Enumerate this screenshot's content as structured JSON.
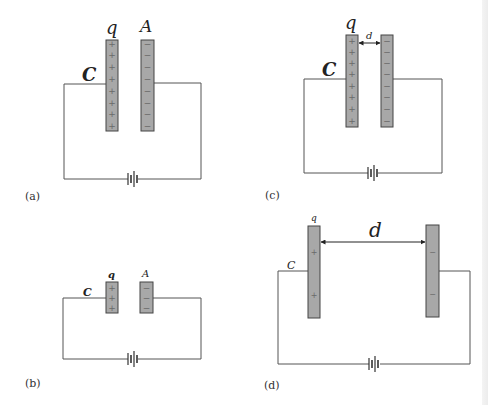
{
  "figure": {
    "colors": {
      "plate_fill": "#a8a8a8",
      "plate_stroke": "#444444",
      "wire": "#555555",
      "background": "#ffffff"
    },
    "panels": [
      {
        "id": "a",
        "label": "(a)",
        "capacitance_label": "C",
        "charge_label": "q",
        "area_label": "A",
        "positive_signs": [
          "+",
          "+",
          "+",
          "+",
          "+",
          "+",
          "+",
          "+"
        ],
        "negative_signs": [
          "−",
          "−",
          "−",
          "−",
          "−",
          "−",
          "−",
          "−"
        ],
        "plate_separation_label": null
      },
      {
        "id": "b",
        "label": "(b)",
        "capacitance_label": "C",
        "charge_label": "q",
        "area_label": "A",
        "positive_signs": [
          "+",
          "+",
          "+"
        ],
        "negative_signs": [
          "−",
          "−",
          "−"
        ],
        "plate_separation_label": null
      },
      {
        "id": "c",
        "label": "(c)",
        "capacitance_label": "C",
        "charge_label": "q",
        "area_label": null,
        "positive_signs": [
          "+",
          "+",
          "+",
          "+",
          "+",
          "+",
          "+",
          "+"
        ],
        "negative_signs": [
          "−",
          "−",
          "−",
          "−",
          "−",
          "−",
          "−",
          "−"
        ],
        "plate_separation_label": "d"
      },
      {
        "id": "d",
        "label": "(d)",
        "capacitance_label": "C",
        "charge_label": "q",
        "area_label": null,
        "positive_signs": [
          "+",
          "+"
        ],
        "negative_signs": [
          "−",
          "−"
        ],
        "plate_separation_label": "d"
      }
    ]
  }
}
